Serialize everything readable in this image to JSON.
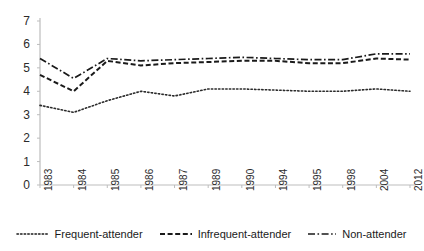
{
  "chart_data": {
    "type": "line",
    "title": "",
    "xlabel": "",
    "ylabel": "",
    "categories": [
      "1983",
      "1984",
      "1985",
      "1986",
      "1987",
      "1989",
      "1990",
      "1994",
      "1995",
      "1998",
      "2004",
      "2012"
    ],
    "ylim": [
      0,
      7
    ],
    "yticks": [
      0,
      1,
      2,
      3,
      4,
      5,
      6,
      7
    ],
    "grid": false,
    "legend_position": "bottom",
    "series": [
      {
        "name": "Frequent-attender",
        "style": "dotted",
        "color": "#2b2b2b",
        "values": [
          3.4,
          3.1,
          3.6,
          4.0,
          3.8,
          4.1,
          4.1,
          4.05,
          4.0,
          4.0,
          4.1,
          4.0
        ]
      },
      {
        "name": "Infrequent-attender",
        "style": "dashed",
        "color": "#1a1a1a",
        "values": [
          4.7,
          4.0,
          5.3,
          5.1,
          5.2,
          5.25,
          5.3,
          5.3,
          5.2,
          5.2,
          5.4,
          5.35
        ]
      },
      {
        "name": "Non-attender",
        "style": "dash-dot",
        "color": "#1a1a1a",
        "values": [
          5.4,
          4.55,
          5.4,
          5.3,
          5.35,
          5.4,
          5.45,
          5.4,
          5.35,
          5.35,
          5.6,
          5.6
        ]
      }
    ]
  },
  "legend": {
    "items": [
      {
        "label": "Frequent-attender",
        "style": "dotted"
      },
      {
        "label": "Infrequent-attender",
        "style": "dashed"
      },
      {
        "label": "Non-attender",
        "style": "dash-dot"
      }
    ]
  },
  "axes": {
    "y_tick_labels": [
      "7",
      "6",
      "5",
      "4",
      "3",
      "2",
      "1",
      "0"
    ],
    "x_tick_labels": [
      "1983",
      "1984",
      "1985",
      "1986",
      "1987",
      "1989",
      "1990",
      "1994",
      "1995",
      "1998",
      "2004",
      "2012"
    ],
    "axis_color": "#bdbdbd"
  }
}
